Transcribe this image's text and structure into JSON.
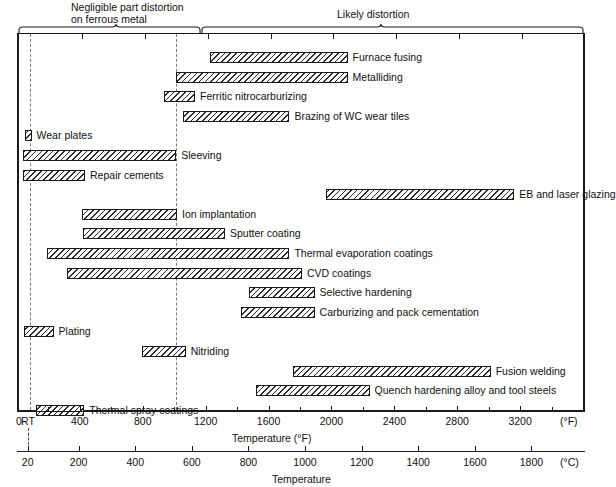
{
  "headers": {
    "left": "Negligible part distortion\non ferrous metal",
    "right": "Likely distortion"
  },
  "chart_data": {
    "type": "bar",
    "orientation": "horizontal-range",
    "title": "",
    "xlabel": "Temperature (°F)",
    "xlabel_secondary": "Temperature",
    "unit_primary": "(°F)",
    "unit_secondary": "(°C)",
    "xlim_f": [
      0,
      3600
    ],
    "xlim_c": [
      -18,
      1982
    ],
    "axis_f_ticks": [
      "0",
      "RT",
      "400",
      "800",
      "1200",
      "1600",
      "2000",
      "2400",
      "2800",
      "3200"
    ],
    "axis_f_tick_values": [
      0,
      70,
      400,
      800,
      1200,
      1600,
      2000,
      2400,
      2800,
      3200
    ],
    "axis_f_minor_values": [
      200,
      600,
      1000,
      1400,
      1800,
      2200,
      2600,
      3000,
      3400
    ],
    "axis_c_ticks": [
      "20",
      "200",
      "400",
      "600",
      "800",
      "1000",
      "1200",
      "1400",
      "1600",
      "1800"
    ],
    "axis_c_tick_values_f": [
      68,
      392,
      752,
      1112,
      1472,
      1832,
      2192,
      2552,
      2912,
      3272
    ],
    "annotations": {
      "rt_marker": "RT",
      "zero_marker": "0",
      "divider_f": 1000
    },
    "grid": false,
    "legend": null,
    "categories": [
      "Furnace fusing",
      "Metalliding",
      "Ferritic nitrocarburizing",
      "Brazing of WC wear tiles",
      "Wear plates",
      "Sleeving",
      "Repair cements",
      "EB and laser glazing",
      "Ion implantation",
      "Sputter coating",
      "Thermal evaporation coatings",
      "CVD coatings",
      "Selective hardening",
      "Carburizing and pack cementation",
      "Plating",
      "Nitriding",
      "Fusion welding",
      "Quench hardening alloy and tool steels",
      "Thermal spray coatings"
    ],
    "bars": [
      {
        "label": "Furnace fusing",
        "start_f": 1215,
        "end_f": 2090
      },
      {
        "label": "Metalliding",
        "start_f": 1000,
        "end_f": 2090
      },
      {
        "label": "Ferritic nitrocarburizing",
        "start_f": 920,
        "end_f": 1120
      },
      {
        "label": "Brazing of WC wear tiles",
        "start_f": 1040,
        "end_f": 1720
      },
      {
        "label": "Wear plates",
        "start_f": 35,
        "end_f": 80
      },
      {
        "label": "Sleeving",
        "start_f": 25,
        "end_f": 1000
      },
      {
        "label": "Repair cements",
        "start_f": 25,
        "end_f": 420
      },
      {
        "label": "EB and laser glazing",
        "start_f": 1955,
        "end_f": 3150
      },
      {
        "label": "Ion implantation",
        "start_f": 400,
        "end_f": 1005
      },
      {
        "label": "Sputter coating",
        "start_f": 405,
        "end_f": 1310
      },
      {
        "label": "Thermal evaporation coatings",
        "start_f": 175,
        "end_f": 1720
      },
      {
        "label": "CVD coatings",
        "start_f": 305,
        "end_f": 1800
      },
      {
        "label": "Selective hardening",
        "start_f": 1460,
        "end_f": 1880
      },
      {
        "label": "Carburizing and pack cementation",
        "start_f": 1415,
        "end_f": 1880
      },
      {
        "label": "Plating",
        "start_f": 30,
        "end_f": 220
      },
      {
        "label": "Nitriding",
        "start_f": 780,
        "end_f": 1060
      },
      {
        "label": "Fusion welding",
        "start_f": 1740,
        "end_f": 3000
      },
      {
        "label": "Quench hardening alloy and tool steels",
        "start_f": 1510,
        "end_f": 2230
      },
      {
        "label": "Thermal spray coatings",
        "start_f": 105,
        "end_f": 415
      }
    ]
  }
}
